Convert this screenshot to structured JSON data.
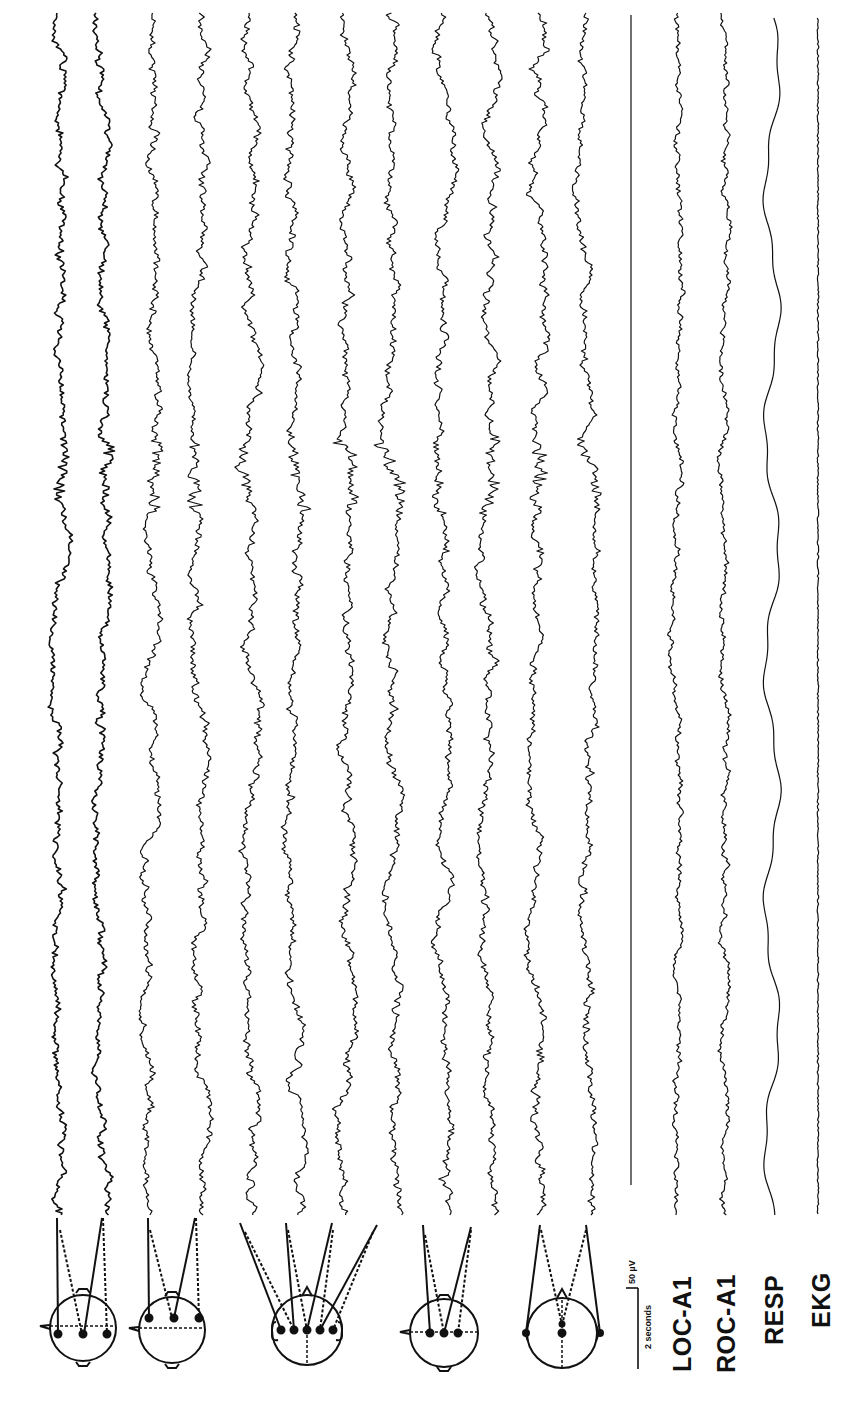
{
  "figure": {
    "orientation": "rotated -90deg (time runs top-to-bottom)",
    "ink_color": "#111111",
    "background": "#ffffff"
  },
  "scale_bar": {
    "amplitude_label": "50 µV",
    "time_label": "2 seconds"
  },
  "channels": {
    "eeg_groups": [
      {
        "name": "group-1",
        "montage": "parasagittal-left-temporal",
        "traces": 2
      },
      {
        "name": "group-2",
        "montage": "frontal",
        "traces": 2
      },
      {
        "name": "group-3",
        "montage": "coronal-transverse",
        "traces": 4
      },
      {
        "name": "group-4",
        "montage": "central",
        "traces": 2
      },
      {
        "name": "group-5",
        "montage": "occipital-referential",
        "traces": 2
      }
    ],
    "labels": [
      {
        "id": "loc",
        "text": "LOC-A1"
      },
      {
        "id": "roc",
        "text": "ROC-A1"
      },
      {
        "id": "resp",
        "text": "RESP"
      },
      {
        "id": "ekg",
        "text": "EKG"
      }
    ]
  },
  "chart_data": {
    "type": "line",
    "title": "",
    "xlabel": "time (2 s scale bar)",
    "ylabel": "amplitude (50 µV scale bar)",
    "grid": false,
    "legend": "channel labels beneath traces",
    "series": [
      {
        "name": "EEG-1",
        "x_center": 60,
        "amp": 9,
        "style": "eeg",
        "seed": 11
      },
      {
        "name": "EEG-2",
        "x_center": 100,
        "amp": 9,
        "style": "eeg",
        "seed": 23
      },
      {
        "name": "EEG-3",
        "x_center": 152,
        "amp": 10,
        "style": "eeg",
        "seed": 37
      },
      {
        "name": "EEG-4",
        "x_center": 200,
        "amp": 10,
        "style": "eeg",
        "seed": 41
      },
      {
        "name": "EEG-5",
        "x_center": 252,
        "amp": 11,
        "style": "eeg",
        "seed": 53
      },
      {
        "name": "EEG-6",
        "x_center": 296,
        "amp": 11,
        "style": "eeg",
        "seed": 67
      },
      {
        "name": "EEG-7",
        "x_center": 345,
        "amp": 11,
        "style": "eeg",
        "seed": 71
      },
      {
        "name": "EEG-8",
        "x_center": 392,
        "amp": 11,
        "style": "eeg",
        "seed": 83
      },
      {
        "name": "EEG-9",
        "x_center": 444,
        "amp": 10,
        "style": "eeg",
        "seed": 97
      },
      {
        "name": "EEG-10",
        "x_center": 490,
        "amp": 10,
        "style": "eeg",
        "seed": 101
      },
      {
        "name": "EEG-11",
        "x_center": 540,
        "amp": 11,
        "style": "eeg",
        "seed": 113
      },
      {
        "name": "EEG-12",
        "x_center": 586,
        "amp": 10,
        "style": "eeg",
        "seed": 127
      },
      {
        "name": "Baseline",
        "x_center": 631,
        "amp": 0,
        "style": "flat",
        "seed": 0
      },
      {
        "name": "LOC-A1",
        "x_center": 678,
        "amp": 7,
        "style": "eog",
        "seed": 131
      },
      {
        "name": "ROC-A1",
        "x_center": 724,
        "amp": 7,
        "style": "eog",
        "seed": 139
      },
      {
        "name": "RESP",
        "x_center": 772,
        "amp": 8,
        "style": "resp",
        "seed": 0
      },
      {
        "name": "EKG",
        "x_center": 818,
        "amp": 1,
        "style": "ekg",
        "seed": 149
      }
    ],
    "y_range_px": [
      13,
      1215
    ],
    "events": [
      {
        "type": "arousal-transition",
        "y_px": 455
      },
      {
        "type": "eye-movement",
        "y_px": 150
      }
    ]
  }
}
